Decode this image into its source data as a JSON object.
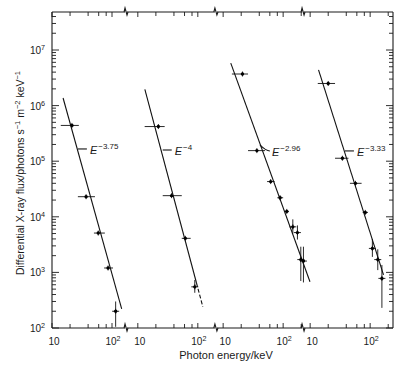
{
  "chart_data": {
    "type": "scatter",
    "subtype": "log-log spectra with power-law fits on a broken (4-panel) energy axis",
    "title": "",
    "xlabel": "Photon energy/keV",
    "ylabel": "Differential X-ray flux/photons s^-1 m^-2 keV^-1",
    "ylabel_parts": [
      "Differential X-ray flux/photons s",
      "−1",
      " m",
      "−2",
      " keV",
      "−1"
    ],
    "xscale": "log",
    "yscale": "log",
    "ylim": [
      100,
      48000000
    ],
    "grid": false,
    "legend": null,
    "yticks": [
      {
        "value": 100,
        "base": "10",
        "exp": "2"
      },
      {
        "value": 1000,
        "base": "10",
        "exp": "3"
      },
      {
        "value": 10000,
        "base": "10",
        "exp": "4"
      },
      {
        "value": 100000,
        "base": "10",
        "exp": "5"
      },
      {
        "value": 1000000,
        "base": "10",
        "exp": "6"
      },
      {
        "value": 10000000,
        "base": "10",
        "exp": "7"
      }
    ],
    "xticks": [
      10,
      20,
      40,
      60,
      80,
      100,
      200
    ],
    "xtick_labels": [
      {
        "value": 10,
        "base": "10",
        "exp": ""
      },
      {
        "value": 100,
        "base": "10",
        "exp": "2"
      }
    ],
    "panels": [
      {
        "name": "spectrum-1",
        "xlim": [
          10,
          165
        ],
        "fit": {
          "index": -3.75,
          "from": [
            15.3,
            1370000
          ],
          "to": [
            145,
            220
          ],
          "dashed_from": null
        },
        "label": {
          "base": "E",
          "exp": "−3.75",
          "x": 27,
          "y": 166000,
          "leader_dy": 0
        },
        "points": [
          {
            "x": 21.5,
            "y": 440000,
            "xerr": [
              14,
              28
            ]
          },
          {
            "x": 37,
            "y": 23000,
            "xerr": [
              27,
              52
            ]
          },
          {
            "x": 59,
            "y": 5100,
            "xerr": [
              50,
              76
            ]
          },
          {
            "x": 86,
            "y": 1200,
            "xerr": [
              74,
              104
            ]
          },
          {
            "x": 115,
            "y": 200,
            "yerr": [
              105,
              300
            ]
          }
        ]
      },
      {
        "name": "spectrum-2",
        "xlim": [
          6.6,
          192
        ],
        "fit": {
          "index": -4,
          "from": [
            13.1,
            1960000
          ],
          "to": [
            121,
            242
          ],
          "dashed_from": 95
        },
        "label": {
          "base": "E",
          "exp": "−4",
          "x": 26,
          "y": 159000,
          "leader_dy": 0
        },
        "points": [
          {
            "x": 22,
            "y": 420000,
            "xerr": [
              13,
              28
            ]
          },
          {
            "x": 36.5,
            "y": 24000,
            "xerr": [
              26,
              54
            ]
          },
          {
            "x": 62,
            "y": 4100,
            "xerr": [
              54,
              76
            ]
          },
          {
            "x": 89,
            "y": 550,
            "yerr": [
              430,
              730
            ]
          }
        ]
      },
      {
        "name": "spectrum-3",
        "xlim": [
          7.9,
          207
        ],
        "fit": {
          "index": -2.96,
          "from": [
            13.4,
            5800000
          ],
          "to": [
            280,
            680
          ],
          "dashed_from": null
        },
        "label": {
          "base": "E",
          "exp": "−2.96",
          "x": 41,
          "y": 196000,
          "leader_dy": 6
        },
        "points": [
          {
            "x": 21,
            "y": 3700000,
            "xerr": [
              14,
              26
            ]
          },
          {
            "x": 36.5,
            "y": 155000,
            "xerr": [
              26,
              50
            ]
          },
          {
            "x": 62,
            "y": 43000,
            "xerr": [
              54,
              72
            ]
          },
          {
            "x": 89,
            "y": 22000,
            "xerr": [
              80,
              100
            ]
          },
          {
            "x": 115,
            "y": 12500,
            "xerr": [
              105,
              125
            ]
          },
          {
            "x": 145,
            "y": 6600,
            "yerr": [
              5000,
              9000
            ]
          },
          {
            "x": 173,
            "y": 5200,
            "yerr": [
              3900,
              7000
            ]
          },
          {
            "x": 197,
            "y": 1700,
            "yerr": [
              700,
              2900
            ]
          },
          {
            "x": 218,
            "y": 1600,
            "yerr": [
              660,
              2900
            ]
          }
        ]
      },
      {
        "name": "spectrum-4",
        "xlim": [
          7.9,
          251
        ],
        "fit": {
          "index": -3.33,
          "from": [
            13.8,
            4400000
          ],
          "to": [
            167,
            900
          ],
          "dashed_from": null
        },
        "label": {
          "base": "E",
          "exp": "−3.33",
          "x": 38,
          "y": 153000,
          "leader_dy": 0
        },
        "points": [
          {
            "x": 20,
            "y": 2500000,
            "xerr": [
              13.4,
              26
            ]
          },
          {
            "x": 34.5,
            "y": 113000,
            "xerr": [
              26,
              43.5
            ]
          },
          {
            "x": 57,
            "y": 40000,
            "xerr": [
              46,
              72
            ]
          },
          {
            "x": 83,
            "y": 12000,
            "xerr": [
              75,
              92
            ]
          },
          {
            "x": 109,
            "y": 2700,
            "yerr": [
              1900,
              4000
            ]
          },
          {
            "x": 134,
            "y": 1700,
            "yerr": [
              1100,
              2600
            ]
          },
          {
            "x": 157,
            "y": 780,
            "yerr": [
              230,
              1360
            ]
          }
        ]
      }
    ]
  }
}
